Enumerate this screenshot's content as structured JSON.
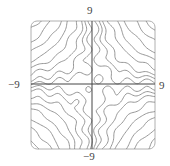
{
  "chart_data": {
    "type": "contour",
    "title": "",
    "xlabel": "",
    "ylabel": "",
    "xlim": [
      -9,
      9
    ],
    "ylim": [
      -9,
      9
    ],
    "tick_labels": {
      "top": "9",
      "bottom": "−9",
      "left": "−9",
      "right": "9"
    },
    "grid": false,
    "legend": null,
    "frame": "rounded-square",
    "function_description": "level curves of a saddle-like surface (approximately x*y with sinusoidal ripple); axes x=0 and y=0 are contour lines",
    "contour_levels": [
      -70,
      -55,
      -42,
      -31,
      -22,
      -14,
      -8,
      -3,
      0,
      3,
      8,
      14,
      22,
      31,
      42,
      55,
      70
    ],
    "ripple_amplitude": 2.2,
    "line_color": "#8a8a8a",
    "axis_line_color": "#444444",
    "frame_color": "#b0b0b0"
  }
}
